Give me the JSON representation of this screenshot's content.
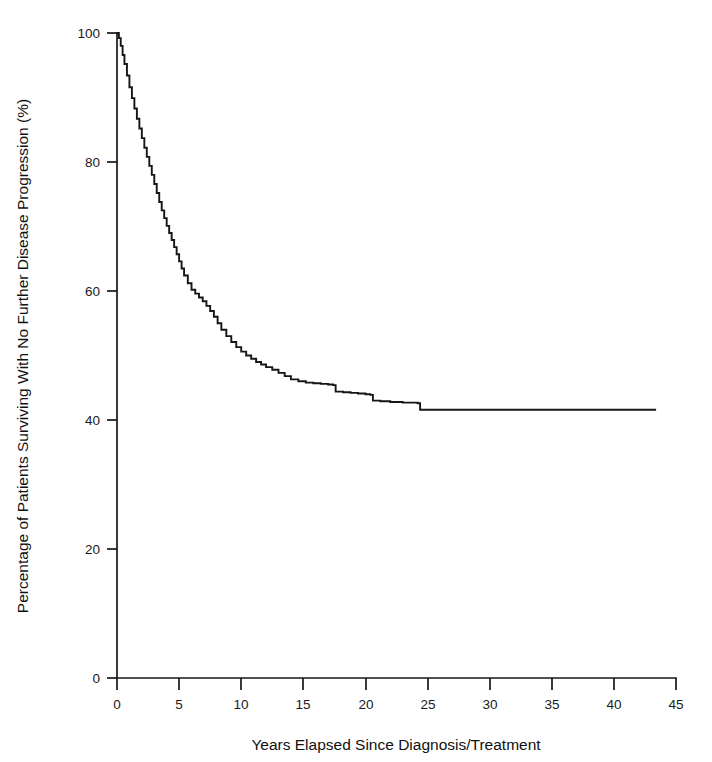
{
  "chart_data": {
    "type": "line",
    "subtype": "kaplan-meier-survival",
    "title": "",
    "subtitle": "",
    "xlabel": "Years Elapsed Since Diagnosis/Treatment",
    "ylabel": "Percentage of Patients Surviving With No Further Disease Progression (%)",
    "xlim": [
      0,
      45
    ],
    "ylim": [
      0,
      100
    ],
    "xticks": [
      0,
      5,
      10,
      15,
      20,
      25,
      30,
      35,
      40,
      45
    ],
    "xtick_labels": [
      "0",
      "5",
      "10",
      "15",
      "20",
      "25",
      "30",
      "35",
      "40",
      "45"
    ],
    "yticks": [
      0,
      20,
      40,
      60,
      80,
      100
    ],
    "ytick_labels": [
      "0",
      "20",
      "40",
      "60",
      "80",
      "100"
    ],
    "grid": false,
    "legend": null,
    "legend_position": "none",
    "line_color": "#161616",
    "series": [
      {
        "name": "Progression-free survival",
        "x": [
          0.0,
          0.15,
          0.3,
          0.45,
          0.6,
          0.8,
          1.0,
          1.2,
          1.4,
          1.6,
          1.8,
          2.0,
          2.2,
          2.4,
          2.6,
          2.8,
          3.0,
          3.2,
          3.4,
          3.6,
          3.8,
          4.0,
          4.2,
          4.4,
          4.6,
          4.8,
          5.0,
          5.2,
          5.4,
          5.7,
          6.0,
          6.3,
          6.6,
          6.9,
          7.2,
          7.5,
          7.8,
          8.1,
          8.4,
          8.8,
          9.2,
          9.6,
          10.0,
          10.4,
          10.8,
          11.2,
          11.6,
          12.0,
          12.5,
          13.0,
          13.5,
          14.0,
          14.6,
          15.2,
          15.8,
          16.4,
          17.0,
          17.4,
          17.6,
          18.2,
          18.8,
          19.4,
          20.0,
          20.4,
          20.6,
          21.2,
          22.0,
          23.0,
          24.2,
          24.4,
          28.0,
          32.0,
          36.0,
          40.0,
          43.4
        ],
        "y": [
          100.0,
          99.2,
          98.0,
          96.6,
          95.2,
          93.4,
          91.6,
          89.9,
          88.3,
          86.7,
          85.2,
          83.7,
          82.2,
          80.8,
          79.4,
          78.0,
          76.6,
          75.2,
          73.8,
          72.5,
          71.3,
          70.1,
          69.0,
          67.9,
          66.8,
          65.7,
          64.6,
          63.5,
          62.4,
          61.2,
          60.2,
          59.6,
          59.0,
          58.4,
          57.7,
          56.9,
          56.0,
          55.0,
          54.0,
          53.0,
          52.1,
          51.3,
          50.6,
          50.0,
          49.5,
          49.0,
          48.6,
          48.2,
          47.8,
          47.3,
          46.8,
          46.3,
          46.0,
          45.8,
          45.7,
          45.6,
          45.5,
          45.4,
          44.4,
          44.3,
          44.2,
          44.1,
          44.0,
          43.9,
          43.0,
          42.9,
          42.8,
          42.7,
          42.6,
          41.6,
          41.6,
          41.6,
          41.6,
          41.6,
          41.6
        ],
        "notes": "Steep early decline from 100% to ~60% by year 6, gradual stepwise decline to ~42% by year 24, then flat plateau at 41.6% through year 43"
      }
    ],
    "key_values": {
      "start_percent": 100,
      "percent_at_year_5": 64.6,
      "percent_at_year_10": 50.6,
      "percent_at_year_15": 45.8,
      "percent_at_year_20": 44.0,
      "percent_at_year_25": 41.6,
      "plateau_percent": 41.6,
      "last_event_year": 24.3,
      "max_followup_year": 43.4
    }
  },
  "axes": {
    "x_title": "Years Elapsed Since Diagnosis/Treatment",
    "y_title": "Percentage of Patients Surviving With No Further Disease Progression (%)"
  }
}
